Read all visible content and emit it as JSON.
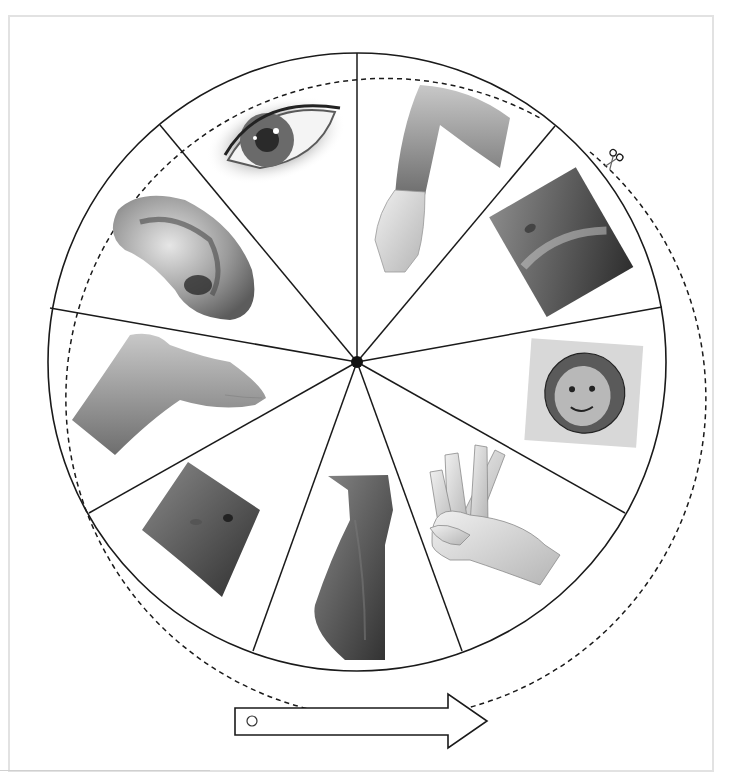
{
  "worksheet": {
    "title": "Body parts spinner",
    "colors": {
      "line": "#1a1a1a",
      "frame": "#e2e2e2",
      "background": "#ffffff"
    }
  },
  "wheel": {
    "center": [
      357,
      362
    ],
    "radius": 309,
    "cut_radius": 320,
    "segments": 9,
    "segments_items": [
      {
        "label": "eye",
        "icon": "eye-photo"
      },
      {
        "label": "arm",
        "icon": "arm-photo"
      },
      {
        "label": "chest",
        "icon": "chest-photo"
      },
      {
        "label": "face",
        "icon": "face-photo"
      },
      {
        "label": "hand",
        "icon": "hand-photo"
      },
      {
        "label": "legs",
        "icon": "legs-photo"
      },
      {
        "label": "belly",
        "icon": "belly-photo"
      },
      {
        "label": "foot",
        "icon": "foot-photo"
      },
      {
        "label": "ear",
        "icon": "ear-photo"
      }
    ],
    "cut_line": {
      "style": "dashed",
      "icon": "scissors-icon"
    }
  },
  "pointer": {
    "label": "spinner arrow",
    "icon": "arrow-pointer",
    "hole_icon": "pin-hole"
  }
}
